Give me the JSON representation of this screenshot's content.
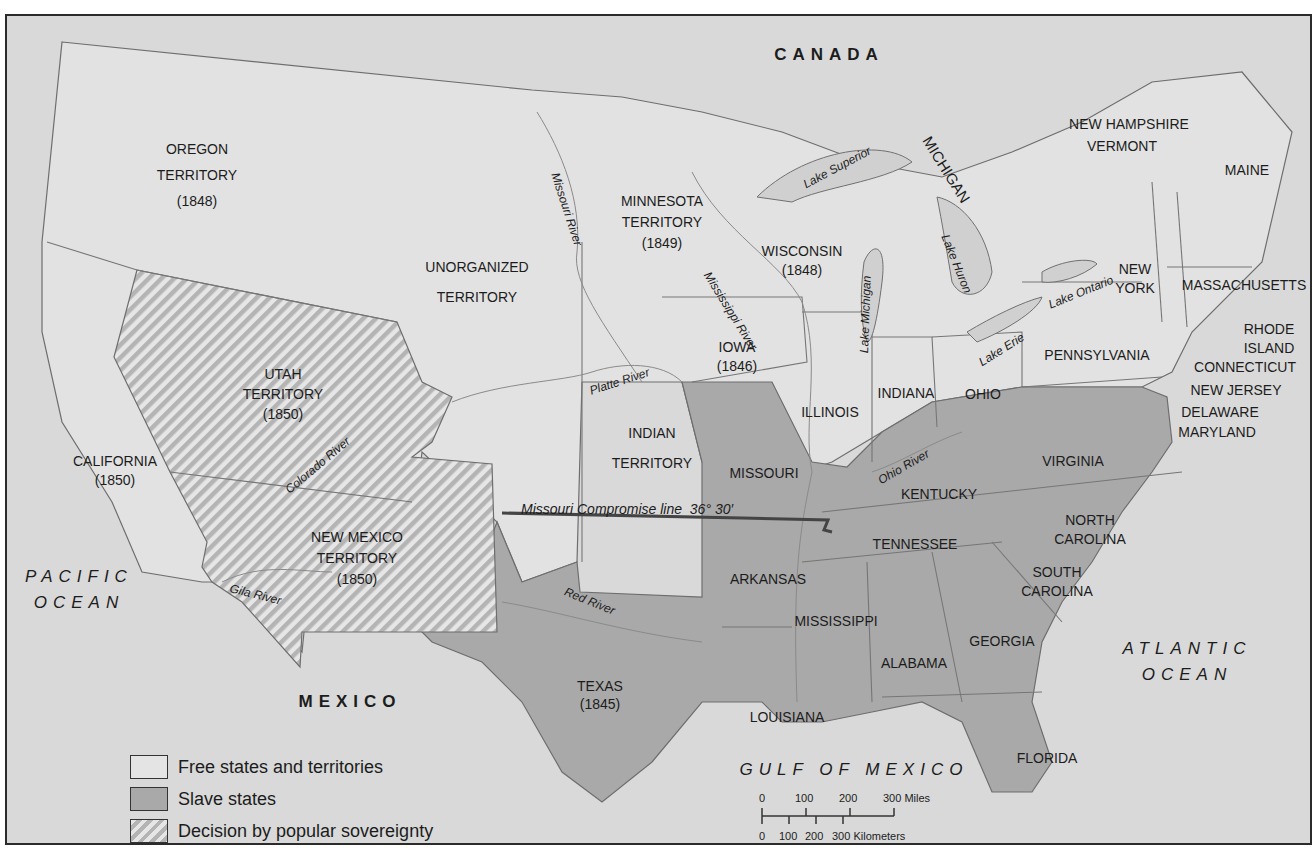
{
  "map": {
    "countries": {
      "canada": "CANADA",
      "mexico": "MEXICO"
    },
    "oceans": {
      "pacific": [
        "PACIFIC",
        "OCEAN"
      ],
      "atlantic": [
        "ATLANTIC",
        "OCEAN"
      ],
      "gulf": "GULF OF MEXICO"
    },
    "regions": {
      "oregon": [
        "OREGON",
        "TERRITORY",
        "(1848)"
      ],
      "unorganized": [
        "UNORGANIZED",
        "TERRITORY"
      ],
      "minnesota": [
        "MINNESOTA",
        "TERRITORY",
        "(1849)"
      ],
      "wisconsin": [
        "WISCONSIN",
        "(1848)"
      ],
      "michigan": "MICHIGAN",
      "iowa": [
        "IOWA",
        "(1846)"
      ],
      "utah": [
        "UTAH",
        "TERRITORY",
        "(1850)"
      ],
      "california": [
        "CALIFORNIA",
        "(1850)"
      ],
      "new_mexico": [
        "NEW MEXICO",
        "TERRITORY",
        "(1850)"
      ],
      "indian": [
        "INDIAN",
        "TERRITORY"
      ],
      "texas": [
        "TEXAS",
        "(1845)"
      ],
      "illinois": "ILLINOIS",
      "indiana": "INDIANA",
      "ohio": "OHIO",
      "missouri": "MISSOURI",
      "kentucky": "KENTUCKY",
      "virginia": "VIRGINIA",
      "tennessee": "TENNESSEE",
      "north_carolina": [
        "NORTH",
        "CAROLINA"
      ],
      "south_carolina": [
        "SOUTH",
        "CAROLINA"
      ],
      "arkansas": "ARKANSAS",
      "mississippi": "MISSISSIPPI",
      "alabama": "ALABAMA",
      "georgia": "GEORGIA",
      "louisiana": "LOUISIANA",
      "florida": "FLORIDA",
      "pennsylvania": "PENNSYLVANIA",
      "new_york": [
        "NEW",
        "YORK"
      ],
      "maine": "MAINE",
      "new_hampshire": "NEW HAMPSHIRE",
      "vermont": "VERMONT",
      "massachusetts": "MASSACHUSETTS",
      "rhode_island": [
        "RHODE",
        "ISLAND"
      ],
      "connecticut": "CONNECTICUT",
      "new_jersey": "NEW JERSEY",
      "delaware": "DELAWARE",
      "maryland": "MARYLAND"
    },
    "water": {
      "missouri_river": "Missouri River",
      "mississippi_river": "Mississippi River",
      "platte_river": "Platte River",
      "colorado_river": "Colorado River",
      "gila_river": "Gila River",
      "red_river": "Red River",
      "ohio_river": "Ohio River",
      "lake_superior": "Lake Superior",
      "lake_michigan": "Lake Michigan",
      "lake_huron": "Lake Huron",
      "lake_erie": "Lake Erie",
      "lake_ontario": "Lake Ontario"
    },
    "compromise_line": {
      "label": "Missouri Compromise line",
      "latitude": "36° 30′"
    },
    "colors": {
      "background": "#d9d9d9",
      "free": "#e4e4e4",
      "slave": "#a9a9a9",
      "popular_sovereignty_stripe": "#b4b4b4",
      "border": "#6e6e6e",
      "frame": "#2b2b2b"
    }
  },
  "legend": {
    "items": [
      {
        "key": "free",
        "label": "Free states and territories"
      },
      {
        "key": "slave",
        "label": "Slave states"
      },
      {
        "key": "popular",
        "label": "Decision by popular sovereignty"
      }
    ]
  },
  "scale_bar": {
    "miles": [
      "0",
      "100",
      "200",
      "300 Miles"
    ],
    "kilometers": [
      "0",
      "100",
      "200",
      "300 Kilometers"
    ]
  }
}
